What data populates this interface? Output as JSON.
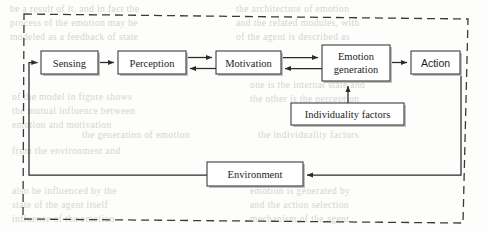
{
  "figure": {
    "boundary_style": "dashed",
    "colors": {
      "box_stroke": "#3c3c3c",
      "box_fill": "#ffffff",
      "arrow": "#2b2b2b",
      "boundary": "#3a3a3a",
      "bleed_text": "#cfcdc8"
    }
  },
  "nodes": {
    "sensing": {
      "label": "Sensing",
      "x": 41,
      "y": 51,
      "w": 57,
      "h": 23
    },
    "perception": {
      "label": "Perception",
      "x": 118,
      "y": 51,
      "w": 68,
      "h": 23
    },
    "motivation": {
      "label": "Motivation",
      "x": 216,
      "y": 51,
      "w": 65,
      "h": 23
    },
    "emotion_generation": {
      "label_line1": "Emotion",
      "label_line2": "generation",
      "x": 322,
      "y": 45,
      "w": 68,
      "h": 36
    },
    "action": {
      "label": "Action",
      "x": 411,
      "y": 51,
      "w": 49,
      "h": 23
    },
    "individuality_factors": {
      "label": "Individuality factors",
      "x": 291,
      "y": 103,
      "w": 113,
      "h": 22
    },
    "environment": {
      "label": "Environment",
      "x": 207,
      "y": 162,
      "w": 96,
      "h": 24
    }
  },
  "edges": [
    {
      "name": "sensing-to-perception",
      "from": "sensing",
      "to": "perception",
      "direction": "forward"
    },
    {
      "name": "perception-to-motivation",
      "from": "perception",
      "to": "motivation",
      "direction": "forward"
    },
    {
      "name": "motivation-to-perception",
      "from": "motivation",
      "to": "perception",
      "direction": "backward"
    },
    {
      "name": "motivation-to-emotion",
      "from": "motivation",
      "to": "emotion_generation",
      "direction": "forward"
    },
    {
      "name": "emotion-to-motivation",
      "from": "emotion_generation",
      "to": "motivation",
      "direction": "backward"
    },
    {
      "name": "emotion-to-action",
      "from": "emotion_generation",
      "to": "action",
      "direction": "forward"
    },
    {
      "name": "individuality-to-emotion",
      "from": "individuality_factors",
      "to": "emotion_generation",
      "direction": "forward"
    },
    {
      "name": "action-to-environment",
      "from": "action",
      "to": "environment",
      "direction": "forward"
    },
    {
      "name": "environment-to-sensing",
      "from": "environment",
      "to": "sensing",
      "direction": "forward"
    }
  ],
  "bleed_text": [
    {
      "text": "be a result of it, and in fact the",
      "x": 10,
      "y": 4
    },
    {
      "text": "process of the  emotion  may be",
      "x": 10,
      "y": 18
    },
    {
      "text": "modeled as a feedback of state",
      "x": 10,
      "y": 32
    },
    {
      "text": "the  architecture  of  emotion",
      "x": 236,
      "y": 4
    },
    {
      "text": "and the related modules, with",
      "x": 236,
      "y": 18
    },
    {
      "text": "of  the  agent  is  described  as",
      "x": 236,
      "y": 32
    },
    {
      "text": "one  is  the  internal  state  and",
      "x": 250,
      "y": 80
    },
    {
      "text": "the  other  is  the  perception",
      "x": 250,
      "y": 94
    },
    {
      "text": "of the  model  in  figure  shows",
      "x": 12,
      "y": 92
    },
    {
      "text": "the mutual influence between",
      "x": 12,
      "y": 106
    },
    {
      "text": "emotion and motivation",
      "x": 12,
      "y": 120
    },
    {
      "text": "the  generation  of  emotion",
      "x": 82,
      "y": 130
    },
    {
      "text": "from  the  environment  and",
      "x": 12,
      "y": 146
    },
    {
      "text": "the  individuality  factors",
      "x": 258,
      "y": 130
    },
    {
      "text": "also  be  influenced  by  the",
      "x": 12,
      "y": 186
    },
    {
      "text": "state  of  the  agent  itself",
      "x": 12,
      "y": 200
    },
    {
      "text": "emotion  is  generated  by",
      "x": 250,
      "y": 186
    },
    {
      "text": "and  the  action  selection",
      "x": 250,
      "y": 200
    },
    {
      "text": "influence  of  the  emotion",
      "x": 12,
      "y": 214
    },
    {
      "text": "mechanism  of  the  agent",
      "x": 250,
      "y": 214
    }
  ]
}
